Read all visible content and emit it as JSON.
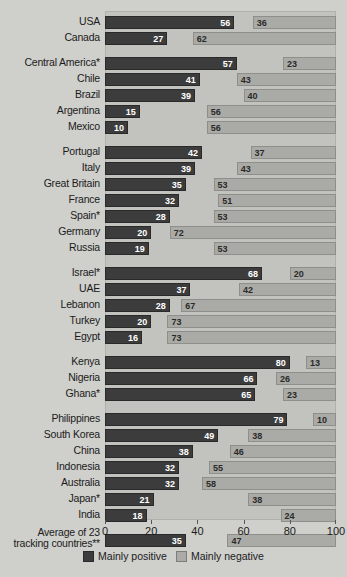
{
  "chart_data": {
    "type": "bar",
    "orientation": "horizontal",
    "layout": "diverging-paired",
    "title": "",
    "xlabel": "",
    "ylabel": "",
    "xlim": [
      0,
      100
    ],
    "xticks": [
      0,
      20,
      40,
      60,
      80,
      100
    ],
    "grid": false,
    "legend_position": "bottom",
    "series": [
      {
        "name": "Mainly positive",
        "color": "#3c3c3c",
        "anchor": "left",
        "values": [
          56,
          27,
          57,
          41,
          39,
          15,
          10,
          42,
          39,
          35,
          32,
          28,
          20,
          19,
          68,
          37,
          28,
          20,
          16,
          80,
          66,
          65,
          79,
          49,
          38,
          32,
          32,
          21,
          18,
          35
        ]
      },
      {
        "name": "Mainly negative",
        "color": "#aaaaa6",
        "anchor": "right",
        "values": [
          36,
          62,
          23,
          43,
          40,
          56,
          56,
          37,
          43,
          53,
          51,
          53,
          72,
          53,
          20,
          42,
          67,
          73,
          73,
          13,
          26,
          23,
          10,
          38,
          46,
          55,
          58,
          38,
          24,
          47
        ]
      }
    ],
    "categories": [
      "USA",
      "Canada",
      "Central America*",
      "Chile",
      "Brazil",
      "Argentina",
      "Mexico",
      "Portugal",
      "Italy",
      "Great Britain",
      "France",
      "Spain*",
      "Germany",
      "Russia",
      "Israel*",
      "UAE",
      "Lebanon",
      "Turkey",
      "Egypt",
      "Kenya",
      "Nigeria",
      "Ghana*",
      "Philippines",
      "South Korea",
      "China",
      "Indonesia",
      "Australia",
      "Japan*",
      "India",
      "Average of 23 tracking countries**"
    ],
    "groups": [
      {
        "rows": [
          {
            "label": "USA",
            "positive": 56,
            "negative": 36
          },
          {
            "label": "Canada",
            "positive": 27,
            "negative": 62
          }
        ]
      },
      {
        "rows": [
          {
            "label": "Central America*",
            "positive": 57,
            "negative": 23
          },
          {
            "label": "Chile",
            "positive": 41,
            "negative": 43
          },
          {
            "label": "Brazil",
            "positive": 39,
            "negative": 40
          },
          {
            "label": "Argentina",
            "positive": 15,
            "negative": 56
          },
          {
            "label": "Mexico",
            "positive": 10,
            "negative": 56
          }
        ]
      },
      {
        "rows": [
          {
            "label": "Portugal",
            "positive": 42,
            "negative": 37
          },
          {
            "label": "Italy",
            "positive": 39,
            "negative": 43
          },
          {
            "label": "Great Britain",
            "positive": 35,
            "negative": 53
          },
          {
            "label": "France",
            "positive": 32,
            "negative": 51
          },
          {
            "label": "Spain*",
            "positive": 28,
            "negative": 53
          },
          {
            "label": "Germany",
            "positive": 20,
            "negative": 72
          },
          {
            "label": "Russia",
            "positive": 19,
            "negative": 53
          }
        ]
      },
      {
        "rows": [
          {
            "label": "Israel*",
            "positive": 68,
            "negative": 20
          },
          {
            "label": "UAE",
            "positive": 37,
            "negative": 42
          },
          {
            "label": "Lebanon",
            "positive": 28,
            "negative": 67
          },
          {
            "label": "Turkey",
            "positive": 20,
            "negative": 73
          },
          {
            "label": "Egypt",
            "positive": 16,
            "negative": 73
          }
        ]
      },
      {
        "rows": [
          {
            "label": "Kenya",
            "positive": 80,
            "negative": 13
          },
          {
            "label": "Nigeria",
            "positive": 66,
            "negative": 26
          },
          {
            "label": "Ghana*",
            "positive": 65,
            "negative": 23
          }
        ]
      },
      {
        "rows": [
          {
            "label": "Philippines",
            "positive": 79,
            "negative": 10
          },
          {
            "label": "South Korea",
            "positive": 49,
            "negative": 38
          },
          {
            "label": "China",
            "positive": 38,
            "negative": 46
          },
          {
            "label": "Indonesia",
            "positive": 32,
            "negative": 55
          },
          {
            "label": "Australia",
            "positive": 32,
            "negative": 58
          },
          {
            "label": "Japan*",
            "positive": 21,
            "negative": 38
          },
          {
            "label": "India",
            "positive": 18,
            "negative": 24
          }
        ]
      },
      {
        "rows": [
          {
            "label": "Average of 23 tracking countries**",
            "label_line1": "Average of 23",
            "label_line2": "tracking countries**",
            "positive": 35,
            "negative": 47
          }
        ]
      }
    ]
  },
  "legend": {
    "items": [
      {
        "label": "Mainly positive",
        "color": "#3c3c3c"
      },
      {
        "label": "Mainly negative",
        "color": "#aaaaa6"
      }
    ]
  },
  "axis": {
    "ticks": [
      "0",
      "20",
      "40",
      "60",
      "80",
      "100"
    ]
  }
}
